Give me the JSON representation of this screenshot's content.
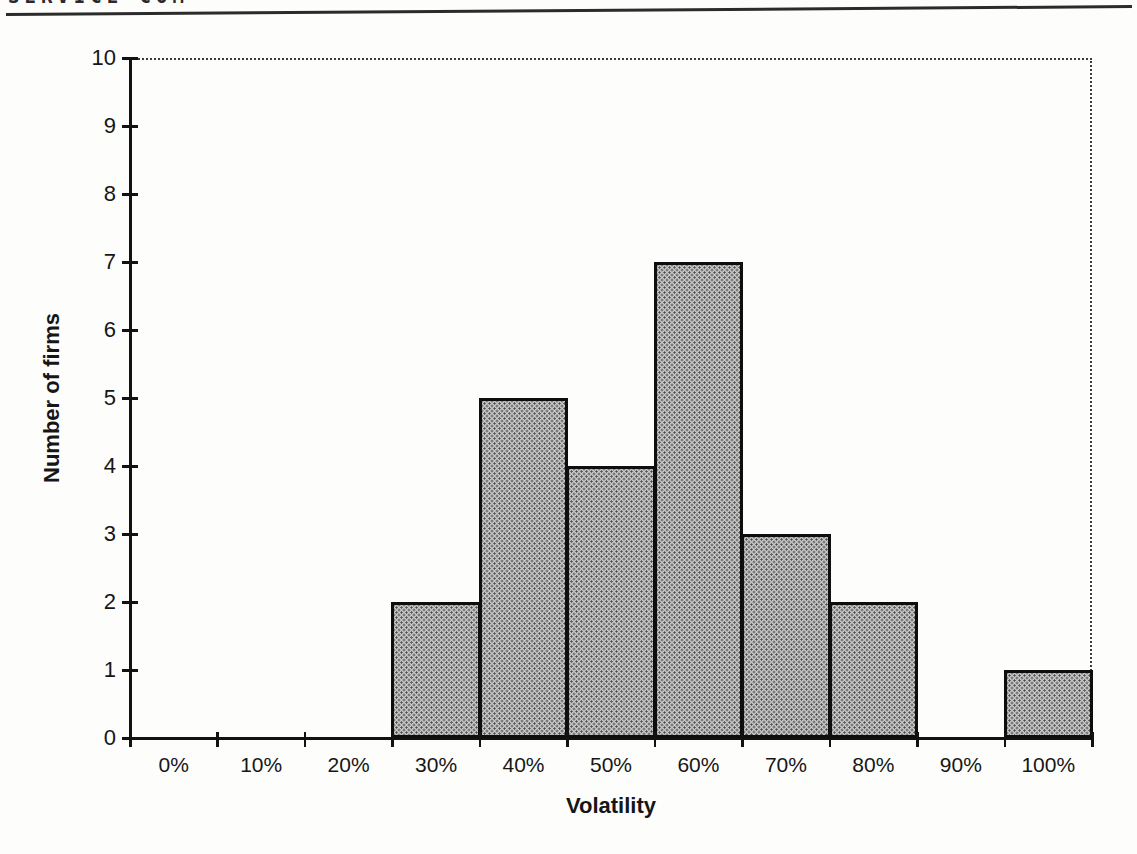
{
  "page": {
    "header_partial_text": "SERVICE COM"
  },
  "chart_data": {
    "type": "bar",
    "title": "",
    "categories": [
      "0%",
      "10%",
      "20%",
      "30%",
      "40%",
      "50%",
      "60%",
      "70%",
      "80%",
      "90%",
      "100%"
    ],
    "values": [
      0,
      0,
      0,
      2,
      5,
      4,
      7,
      3,
      2,
      0,
      1
    ],
    "xlabel": "Volatility",
    "ylabel": "Number of firms",
    "ylim": [
      0,
      10
    ],
    "yticks": [
      0,
      1,
      2,
      3,
      4,
      5,
      6,
      7,
      8,
      9,
      10
    ],
    "grid": false,
    "legend": "none",
    "colors": {
      "bar_fill": "#c6c6c6",
      "bar_dot": "#4e4e4e",
      "bar_border": "#0e0e0e",
      "axis": "#121212",
      "text": "#161616"
    }
  }
}
